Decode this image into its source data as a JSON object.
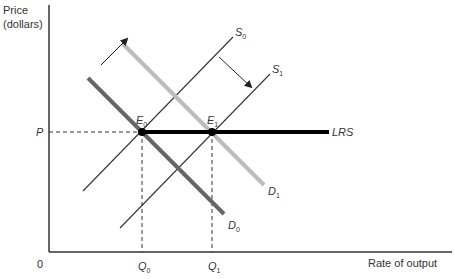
{
  "diagram": {
    "type": "supply-demand",
    "y_axis_label_line1": "Price",
    "y_axis_label_line2": "(dollars)",
    "x_axis_label": "Rate of output",
    "origin_label": "0",
    "price_label": "P",
    "quantity_labels": [
      {
        "base": "Q",
        "sub": "0"
      },
      {
        "base": "Q",
        "sub": "1"
      }
    ],
    "equilibria": [
      {
        "base": "E",
        "sub": "0"
      },
      {
        "base": "E",
        "sub": "1"
      }
    ],
    "curves": {
      "S0": {
        "base": "S",
        "sub": "0"
      },
      "S1": {
        "base": "S",
        "sub": "1"
      },
      "D0": {
        "base": "D",
        "sub": "0"
      },
      "D1": {
        "base": "D",
        "sub": "1"
      },
      "LRS": {
        "label": "LRS"
      }
    },
    "colors": {
      "axis": "#333333",
      "supply": "#333333",
      "demand_initial": "#666666",
      "demand_shifted": "#bbbbbb",
      "lrs": "#000000",
      "guide": "#333333"
    }
  }
}
